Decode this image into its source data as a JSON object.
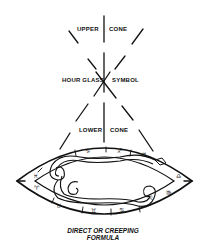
{
  "diagram": {
    "labels": {
      "upper_left": "Upper",
      "upper_right": "Cone",
      "middle_left": "Hour Glass",
      "middle_right": "Symbol",
      "lower_left": "Lower",
      "lower_right": "Cone"
    },
    "caption": {
      "line1": "DIRECT OR CREEPING",
      "line2": "FORMULA"
    },
    "zodiac": {
      "top": [
        "♒",
        "♑",
        "♐",
        "♏"
      ],
      "left": [
        "♓",
        "♈"
      ],
      "bottom": [
        "♉",
        "♊",
        "♋",
        "♌",
        "♍"
      ],
      "right": [
        "♎"
      ]
    },
    "colors": {
      "ink": "#111111",
      "background": "#ffffff"
    }
  }
}
